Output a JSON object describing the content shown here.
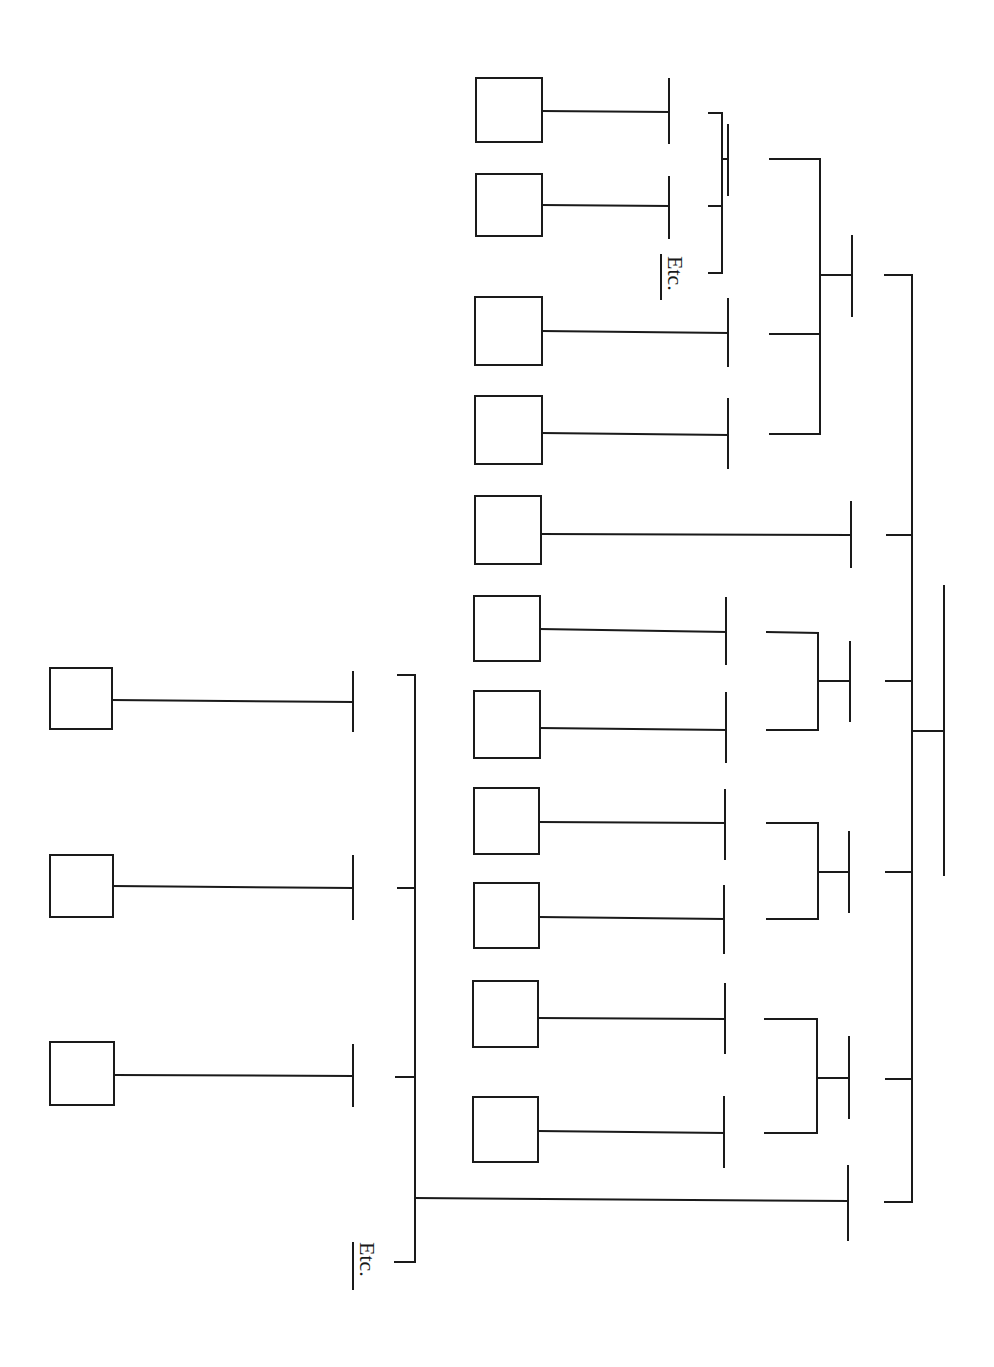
{
  "diagram": {
    "type": "hierarchical-tree-rotated",
    "orientation": "rotated 90 degrees clockwise (leaves left, root right)",
    "colors": {
      "stroke": "#1a1a1a",
      "background": "#ffffff"
    },
    "labels": {
      "etc_top": "Etc.",
      "etc_bottom": "Etc."
    },
    "boxes": [
      {
        "id": "b1",
        "x": 476,
        "y": 78,
        "w": 66,
        "h": 64
      },
      {
        "id": "b2",
        "x": 476,
        "y": 174,
        "w": 66,
        "h": 62
      },
      {
        "id": "b3",
        "x": 475,
        "y": 297,
        "w": 67,
        "h": 68
      },
      {
        "id": "b4",
        "x": 475,
        "y": 396,
        "w": 67,
        "h": 68
      },
      {
        "id": "b5",
        "x": 475,
        "y": 496,
        "w": 66,
        "h": 68
      },
      {
        "id": "b6",
        "x": 474,
        "y": 596,
        "w": 66,
        "h": 65
      },
      {
        "id": "b7",
        "x": 474,
        "y": 691,
        "w": 66,
        "h": 67
      },
      {
        "id": "b8",
        "x": 474,
        "y": 788,
        "w": 65,
        "h": 66
      },
      {
        "id": "b9",
        "x": 474,
        "y": 883,
        "w": 65,
        "h": 65
      },
      {
        "id": "b10",
        "x": 473,
        "y": 981,
        "w": 65,
        "h": 66
      },
      {
        "id": "b11",
        "x": 473,
        "y": 1097,
        "w": 65,
        "h": 65
      },
      {
        "id": "b12",
        "x": 50,
        "y": 668,
        "w": 62,
        "h": 61
      },
      {
        "id": "b13",
        "x": 50,
        "y": 855,
        "w": 63,
        "h": 62
      },
      {
        "id": "b14",
        "x": 50,
        "y": 1042,
        "w": 64,
        "h": 63
      }
    ],
    "lines": [
      [
        542,
        111,
        669,
        112
      ],
      [
        669,
        79,
        669,
        143
      ],
      [
        542,
        205,
        669,
        206
      ],
      [
        669,
        177,
        669,
        238
      ],
      [
        709,
        113,
        722,
        113
      ],
      [
        722,
        113,
        722,
        273
      ],
      [
        709,
        206,
        722,
        206
      ],
      [
        709,
        273,
        722,
        273
      ],
      [
        722,
        159,
        728,
        159
      ],
      [
        728,
        125,
        728,
        195
      ],
      [
        542,
        331,
        728,
        333
      ],
      [
        728,
        299,
        728,
        366
      ],
      [
        542,
        433,
        728,
        435
      ],
      [
        728,
        399,
        728,
        468
      ],
      [
        770,
        159,
        820,
        159
      ],
      [
        820,
        159,
        820,
        434
      ],
      [
        770,
        334,
        820,
        334
      ],
      [
        770,
        434,
        820,
        434
      ],
      [
        820,
        275,
        852,
        275
      ],
      [
        852,
        236,
        852,
        316
      ],
      [
        541,
        534,
        851,
        535
      ],
      [
        851,
        502,
        851,
        567
      ],
      [
        540,
        629,
        726,
        632
      ],
      [
        726,
        598,
        726,
        664
      ],
      [
        540,
        728,
        726,
        730
      ],
      [
        726,
        693,
        726,
        762
      ],
      [
        767,
        632,
        818,
        633
      ],
      [
        818,
        633,
        818,
        730
      ],
      [
        767,
        730,
        818,
        730
      ],
      [
        818,
        681,
        850,
        681
      ],
      [
        850,
        642,
        850,
        721
      ],
      [
        539,
        822,
        725,
        823
      ],
      [
        725,
        790,
        725,
        859
      ],
      [
        539,
        917,
        724,
        919
      ],
      [
        724,
        886,
        724,
        953
      ],
      [
        767,
        823,
        818,
        823
      ],
      [
        818,
        823,
        818,
        919
      ],
      [
        767,
        919,
        818,
        919
      ],
      [
        818,
        872,
        849,
        872
      ],
      [
        849,
        832,
        849,
        912
      ],
      [
        538,
        1018,
        725,
        1019
      ],
      [
        725,
        984,
        725,
        1053
      ],
      [
        538,
        1131,
        724,
        1133
      ],
      [
        724,
        1097,
        724,
        1167
      ],
      [
        765,
        1019,
        817,
        1019
      ],
      [
        817,
        1019,
        817,
        1133
      ],
      [
        765,
        1133,
        817,
        1133
      ],
      [
        817,
        1078,
        849,
        1078
      ],
      [
        849,
        1037,
        849,
        1118
      ],
      [
        885,
        275,
        912,
        275
      ],
      [
        912,
        275,
        912,
        1202
      ],
      [
        887,
        535,
        912,
        535
      ],
      [
        886,
        681,
        912,
        681
      ],
      [
        886,
        872,
        912,
        872
      ],
      [
        886,
        1079,
        912,
        1079
      ],
      [
        885,
        1202,
        912,
        1202
      ],
      [
        912,
        731,
        944,
        731
      ],
      [
        944,
        586,
        944,
        875
      ],
      [
        112,
        700,
        353,
        702
      ],
      [
        353,
        672,
        353,
        731
      ],
      [
        113,
        886,
        353,
        888
      ],
      [
        353,
        856,
        353,
        919
      ],
      [
        114,
        1075,
        353,
        1076
      ],
      [
        353,
        1045,
        353,
        1106
      ],
      [
        398,
        675,
        415,
        675
      ],
      [
        415,
        675,
        415,
        1262
      ],
      [
        398,
        888,
        415,
        888
      ],
      [
        396,
        1077,
        415,
        1077
      ],
      [
        395,
        1262,
        415,
        1262
      ],
      [
        415,
        1198,
        848,
        1201
      ],
      [
        848,
        1166,
        848,
        1240
      ]
    ],
    "etc_labels": [
      {
        "key": "etc_top",
        "x": 668,
        "y": 256,
        "rot": 90,
        "underline": [
          661,
          254,
          661,
          300
        ]
      },
      {
        "key": "etc_bottom",
        "x": 360,
        "y": 1242,
        "rot": 90,
        "underline": [
          353,
          1242,
          353,
          1290
        ]
      }
    ]
  }
}
